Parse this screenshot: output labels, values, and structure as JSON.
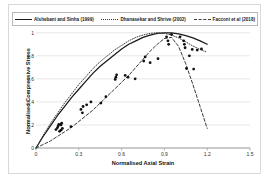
{
  "legend": {
    "items": [
      {
        "label": "Alshebani and Sinha (1999)",
        "style": "solid",
        "color": "#1a1a1a"
      },
      {
        "label": "Dhanasekar and Shrive (2002)",
        "style": "dotted",
        "color": "#3a3a3a"
      },
      {
        "label": "Facconi et al (2018)",
        "style": "dashed",
        "color": "#3a3a3a"
      }
    ]
  },
  "axes": {
    "x_title": "Normalised Axial Strain",
    "y_title": "Normalised Compressive Stress",
    "x_ticks": [
      "0",
      "0.3",
      "0.6",
      "0.9",
      "1.2",
      "1.5"
    ],
    "y_ticks": [
      "0",
      "0.2",
      "0.4",
      "0.6",
      "0.8",
      "1"
    ]
  },
  "chart_data": {
    "type": "line",
    "title": "",
    "xlabel": "Normalised Axial Strain",
    "ylabel": "Normalised Compressive Stress",
    "xlim": [
      0,
      1.5
    ],
    "ylim": [
      0,
      1.05
    ],
    "grid": "horizontal",
    "legend_position": "top",
    "series": [
      {
        "name": "Alshebani and Sinha (1999)",
        "style": "solid",
        "color": "#1a1a1a",
        "x": [
          0.0,
          0.05,
          0.1,
          0.15,
          0.2,
          0.25,
          0.3,
          0.35,
          0.4,
          0.45,
          0.5,
          0.55,
          0.6,
          0.65,
          0.7,
          0.75,
          0.8,
          0.85,
          0.9,
          0.95,
          1.0,
          1.05,
          1.1,
          1.15,
          1.2
        ],
        "y": [
          0.0,
          0.1,
          0.19,
          0.28,
          0.36,
          0.44,
          0.51,
          0.58,
          0.65,
          0.71,
          0.76,
          0.81,
          0.86,
          0.9,
          0.93,
          0.96,
          0.98,
          0.995,
          1.0,
          1.0,
          0.99,
          0.975,
          0.955,
          0.93,
          0.9
        ]
      },
      {
        "name": "Dhanasekar and Shrive (2002)",
        "style": "dotted",
        "color": "#3a3a3a",
        "x": [
          0.0,
          0.05,
          0.1,
          0.15,
          0.2,
          0.25,
          0.3,
          0.35,
          0.4,
          0.45,
          0.5,
          0.55,
          0.6,
          0.65,
          0.7,
          0.75,
          0.8,
          0.85,
          0.9,
          0.95,
          1.0,
          1.05,
          1.1,
          1.15,
          1.2
        ],
        "y": [
          0.0,
          0.11,
          0.21,
          0.3,
          0.39,
          0.47,
          0.55,
          0.62,
          0.69,
          0.75,
          0.8,
          0.85,
          0.89,
          0.93,
          0.96,
          0.98,
          0.995,
          1.0,
          0.995,
          0.98,
          0.955,
          0.92,
          0.885,
          0.855,
          0.83
        ]
      },
      {
        "name": "Facconi et al (2018)",
        "style": "dashed",
        "color": "#3a3a3a",
        "x": [
          0.0,
          0.05,
          0.1,
          0.15,
          0.2,
          0.25,
          0.3,
          0.35,
          0.4,
          0.45,
          0.5,
          0.55,
          0.6,
          0.65,
          0.7,
          0.75,
          0.8,
          0.85,
          0.9,
          0.95,
          1.0,
          1.05,
          1.1,
          1.15,
          1.2
        ],
        "y": [
          0.0,
          0.03,
          0.06,
          0.1,
          0.14,
          0.18,
          0.23,
          0.28,
          0.33,
          0.39,
          0.45,
          0.51,
          0.57,
          0.63,
          0.7,
          0.77,
          0.84,
          0.9,
          0.95,
          0.96,
          0.88,
          0.73,
          0.55,
          0.36,
          0.17
        ]
      }
    ],
    "scatter": {
      "name": "Experimental data",
      "marker": "circle",
      "color": "#111111",
      "points": [
        [
          0.14,
          0.16
        ],
        [
          0.15,
          0.175
        ],
        [
          0.155,
          0.19
        ],
        [
          0.16,
          0.205
        ],
        [
          0.165,
          0.145
        ],
        [
          0.175,
          0.155
        ],
        [
          0.185,
          0.17
        ],
        [
          0.245,
          0.185
        ],
        [
          0.315,
          0.335
        ],
        [
          0.325,
          0.305
        ],
        [
          0.33,
          0.36
        ],
        [
          0.355,
          0.375
        ],
        [
          0.385,
          0.4
        ],
        [
          0.455,
          0.39
        ],
        [
          0.555,
          0.595
        ],
        [
          0.56,
          0.615
        ],
        [
          0.565,
          0.635
        ],
        [
          0.625,
          0.63
        ],
        [
          0.645,
          0.615
        ],
        [
          0.695,
          0.6
        ],
        [
          0.755,
          0.755
        ],
        [
          0.765,
          0.79
        ],
        [
          0.8,
          0.74
        ],
        [
          0.855,
          0.775
        ],
        [
          0.915,
          0.965
        ],
        [
          0.925,
          0.93
        ],
        [
          0.93,
          0.9
        ],
        [
          0.95,
          0.985
        ],
        [
          1.01,
          0.965
        ],
        [
          1.035,
          0.93
        ],
        [
          1.04,
          0.9
        ],
        [
          1.045,
          0.87
        ],
        [
          1.075,
          0.8
        ],
        [
          1.095,
          0.855
        ],
        [
          1.13,
          0.85
        ],
        [
          1.16,
          0.86
        ],
        [
          1.055,
          0.69
        ],
        [
          1.105,
          0.685
        ],
        [
          0.175,
          0.2
        ],
        [
          0.18,
          0.215
        ],
        [
          0.49,
          0.445
        ]
      ]
    }
  }
}
